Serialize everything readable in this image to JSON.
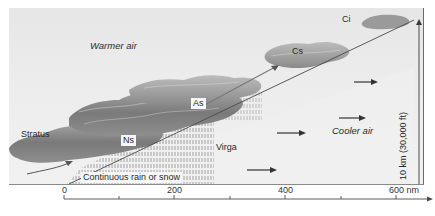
{
  "diagram": {
    "title": "",
    "air_masses": {
      "warm": "Warmer air",
      "cool": "Cooler air"
    },
    "clouds": {
      "ci": "Ci",
      "cs": "Cs",
      "as": "As",
      "ns": "Ns",
      "stratus": "Stratus"
    },
    "precipitation": {
      "virga": "Virga",
      "continuous": "Continuous rain or snow"
    },
    "height_label": "10 km (30,000 ft)",
    "distance_axis": {
      "ticks": [
        "0",
        "200",
        "400",
        "600 nm"
      ],
      "unit": "nm"
    },
    "colors": {
      "background": "#ebebeb",
      "cloud_dark": "#6e6e6e",
      "cloud_light": "#bdbdbd",
      "front_line": "#4a4a4a",
      "arrow": "#333333"
    }
  }
}
